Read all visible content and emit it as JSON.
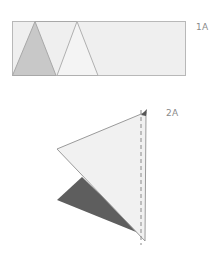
{
  "steps": [
    {
      "label": "1A",
      "description": "Strip with two triangle folds",
      "colors": {
        "strip_fill": "#efefef",
        "strip_stroke": "#b8b8b8",
        "shaded_triangle": "#c8c8c8",
        "outline_triangle": "#f4f4f4"
      }
    },
    {
      "label": "2A",
      "description": "Folded triangle with dashed fold line",
      "colors": {
        "light_triangle": "#f1f1f1",
        "dark_triangle": "#5e5e5e",
        "stroke": "#9a9a9a",
        "dashed_line": "#8a8a8a"
      }
    }
  ]
}
